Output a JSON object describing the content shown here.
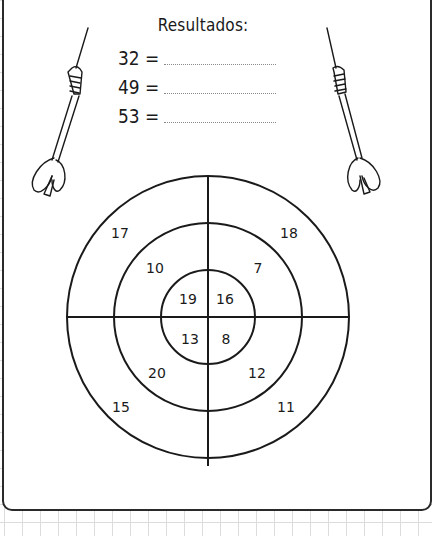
{
  "worksheet": {
    "title": "Resultados:",
    "results": [
      {
        "label": "32 =",
        "answer": ""
      },
      {
        "label": "49 =",
        "answer": ""
      },
      {
        "label": "53 =",
        "answer": ""
      }
    ]
  },
  "dartboard": {
    "rings": [
      "inner",
      "middle",
      "outer"
    ],
    "quadrants": {
      "top_left": {
        "inner": "19",
        "middle": "10",
        "outer": "17"
      },
      "top_right": {
        "inner": "16",
        "middle": "7",
        "outer": "18"
      },
      "bottom_left": {
        "inner": "13",
        "middle": "20",
        "outer": "15"
      },
      "bottom_right": {
        "inner": "8",
        "middle": "12",
        "outer": "11"
      }
    }
  },
  "decorations": [
    "dart-left-icon",
    "dart-right-icon"
  ]
}
